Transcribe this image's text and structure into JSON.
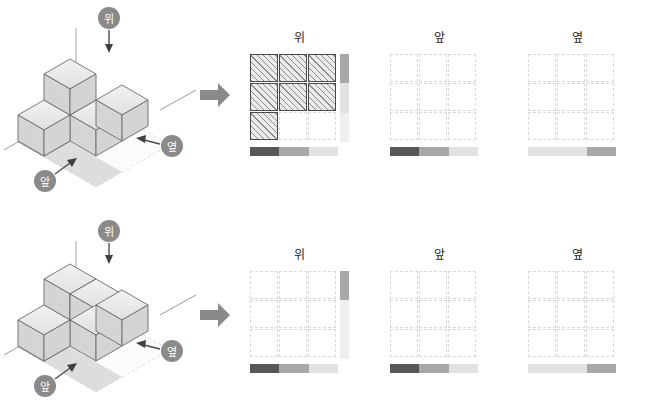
{
  "labels": {
    "top": "위",
    "front": "앞",
    "side": "옆"
  },
  "colors": {
    "dark": "#575757",
    "mid": "#a8a8a8",
    "light": "#e2e2e2",
    "verylight": "#efefef",
    "cube_top": "#e8e8e8",
    "cube_left": "#cccccc",
    "cube_right": "#d8d8d8",
    "outline": "#6b6b6b",
    "badge": "#8a8a8a",
    "arrow": "#8a8a8a",
    "grid_dash": "#d9d9d9",
    "grid_solid": "#4a4a4a"
  },
  "problems": [
    {
      "id": "problem-1",
      "scene": {
        "callouts": [
          {
            "name": "top",
            "label": "위"
          },
          {
            "name": "front",
            "label": "앞"
          },
          {
            "name": "side",
            "label": "옆"
          }
        ]
      },
      "views": [
        {
          "name": "top-view",
          "title": "위",
          "filled": [
            [
              true,
              true,
              true
            ],
            [
              true,
              true,
              true
            ],
            [
              true,
              false,
              false
            ]
          ],
          "bottom_bar": [
            "dark",
            "mid",
            "light"
          ],
          "right_bar": [
            "mid",
            "light",
            "verylight"
          ]
        },
        {
          "name": "front-view",
          "title": "앞",
          "filled": [
            [
              false,
              false,
              false
            ],
            [
              false,
              false,
              false
            ],
            [
              false,
              false,
              false
            ]
          ],
          "bottom_bar": [
            "dark",
            "mid",
            "light"
          ],
          "right_bar": null
        },
        {
          "name": "side-view",
          "title": "옆",
          "filled": [
            [
              false,
              false,
              false
            ],
            [
              false,
              false,
              false
            ],
            [
              false,
              false,
              false
            ]
          ],
          "bottom_bar": [
            "light",
            "light",
            "mid"
          ],
          "right_bar": null
        }
      ]
    },
    {
      "id": "problem-2",
      "scene": {
        "callouts": [
          {
            "name": "top",
            "label": "위"
          },
          {
            "name": "front",
            "label": "앞"
          },
          {
            "name": "side",
            "label": "옆"
          }
        ]
      },
      "views": [
        {
          "name": "top-view",
          "title": "위",
          "filled": [
            [
              false,
              false,
              false
            ],
            [
              false,
              false,
              false
            ],
            [
              false,
              false,
              false
            ]
          ],
          "bottom_bar": [
            "dark",
            "mid",
            "light"
          ],
          "right_bar": [
            "mid",
            "verylight",
            "verylight"
          ]
        },
        {
          "name": "front-view",
          "title": "앞",
          "filled": [
            [
              false,
              false,
              false
            ],
            [
              false,
              false,
              false
            ],
            [
              false,
              false,
              false
            ]
          ],
          "bottom_bar": [
            "dark",
            "mid",
            "light"
          ],
          "right_bar": null
        },
        {
          "name": "side-view",
          "title": "옆",
          "filled": [
            [
              false,
              false,
              false
            ],
            [
              false,
              false,
              false
            ],
            [
              false,
              false,
              false
            ]
          ],
          "bottom_bar": [
            "light",
            "light",
            "mid"
          ],
          "right_bar": null
        }
      ]
    }
  ]
}
